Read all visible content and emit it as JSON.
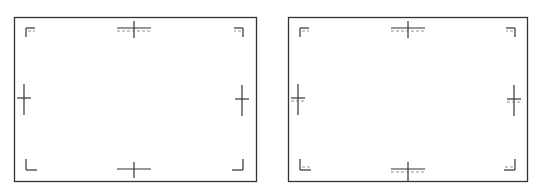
{
  "colors": {
    "background": "#ffffff",
    "line": "#333333",
    "dashed": "#777777"
  },
  "diagrams": [
    {
      "name": "diagram-left",
      "frame": {
        "x": 14,
        "y": 17,
        "w": 242,
        "h": 164
      },
      "corners": [
        {
          "pos": "tl",
          "x": 26,
          "y": 28,
          "len": 9,
          "dashed": true
        },
        {
          "pos": "tr",
          "x": 243,
          "y": 28,
          "len": 9,
          "dashed": true
        },
        {
          "pos": "bl",
          "x": 26,
          "y": 170,
          "len": 11,
          "dashed": false
        },
        {
          "pos": "br",
          "x": 243,
          "y": 170,
          "len": 11,
          "dashed": false
        }
      ],
      "crosses": [
        {
          "pos": "top",
          "cx": 134,
          "cy": 28,
          "hw": 17,
          "vu": 7,
          "vd": 10,
          "dashed": true,
          "dashOffset": 3
        },
        {
          "pos": "bottom",
          "cx": 134,
          "cy": 169,
          "hw": 17,
          "vu": 7,
          "vd": 9,
          "dashed": false
        },
        {
          "pos": "left",
          "cx": 24,
          "cy": 98,
          "hw": 7,
          "vu": 14,
          "vd": 17,
          "dashed": false
        },
        {
          "pos": "right",
          "cx": 242,
          "cy": 99,
          "hw": 7,
          "vu": 14,
          "vd": 17,
          "dashed": false
        }
      ]
    },
    {
      "name": "diagram-right",
      "frame": {
        "x": 288,
        "y": 17,
        "w": 239,
        "h": 164
      },
      "corners": [
        {
          "pos": "tl",
          "x": 300,
          "y": 28,
          "len": 9,
          "dashed": true
        },
        {
          "pos": "tr",
          "x": 515,
          "y": 28,
          "len": 9,
          "dashed": true
        },
        {
          "pos": "bl",
          "x": 300,
          "y": 170,
          "len": 11,
          "dashed": true
        },
        {
          "pos": "br",
          "x": 515,
          "y": 170,
          "len": 11,
          "dashed": true
        }
      ],
      "crosses": [
        {
          "pos": "top",
          "cx": 408,
          "cy": 28,
          "hw": 17,
          "vu": 7,
          "vd": 10,
          "dashed": true,
          "dashOffset": 3
        },
        {
          "pos": "bottom",
          "cx": 408,
          "cy": 169,
          "hw": 17,
          "vu": 7,
          "vd": 12,
          "dashed": true,
          "dashOffset": 3
        },
        {
          "pos": "left",
          "cx": 298,
          "cy": 98,
          "hw": 7,
          "vu": 14,
          "vd": 17,
          "dashed": true,
          "dashOffset": 3
        },
        {
          "pos": "right",
          "cx": 514,
          "cy": 99,
          "hw": 7,
          "vu": 14,
          "vd": 17,
          "dashed": true,
          "dashOffset": 3
        }
      ]
    }
  ]
}
